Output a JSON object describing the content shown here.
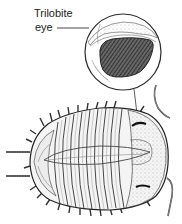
{
  "diagram": {
    "subject": "Trilobite",
    "label": {
      "line1": "Trilobite",
      "line2": "eye"
    },
    "callout": {
      "type": "magnified circle",
      "depicts": "compound eye"
    },
    "colors": {
      "ink": "#222222",
      "shade": "#555555",
      "background": "#ffffff"
    }
  }
}
